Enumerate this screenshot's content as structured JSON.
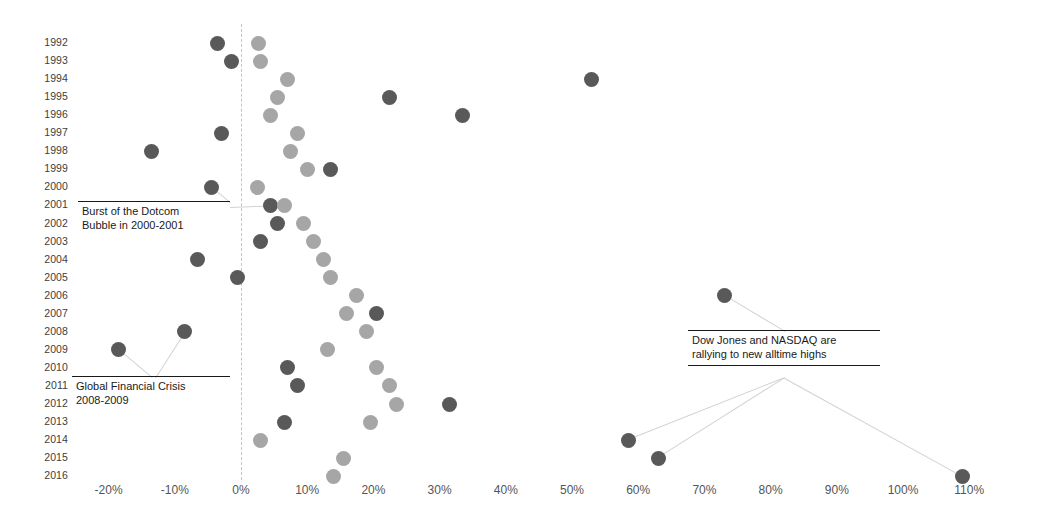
{
  "chart_data": {
    "type": "scatter",
    "title": "",
    "subtitle": "",
    "xlabel": "",
    "ylabel": "",
    "xlim": [
      -25,
      115
    ],
    "ylim_categories": true,
    "grid": false,
    "legend": "none",
    "zero_reference_line": 0,
    "xtick_labels": [
      "-20%",
      "-10%",
      "0%",
      "10%",
      "20%",
      "30%",
      "40%",
      "50%",
      "60%",
      "70%",
      "80%",
      "90%",
      "100%",
      "110%"
    ],
    "xtick_values": [
      -20,
      -10,
      0,
      10,
      20,
      30,
      40,
      50,
      60,
      70,
      80,
      90,
      100,
      110
    ],
    "categories": [
      "1992",
      "1993",
      "1994",
      "1995",
      "1996",
      "1997",
      "1998",
      "1999",
      "2000",
      "2001",
      "2002",
      "2003",
      "2004",
      "2005",
      "2006",
      "2007",
      "2008",
      "2009",
      "2010",
      "2011",
      "2012",
      "2013",
      "2014",
      "2015",
      "2016"
    ],
    "series": [
      {
        "name": "series-dark",
        "color": "#595959",
        "values": [
          -3.5,
          -1.5,
          53.0,
          22.5,
          33.5,
          -3.0,
          -13.5,
          13.5,
          -4.5,
          4.5,
          5.5,
          3.0,
          -6.5,
          -0.5,
          73.0,
          20.5,
          -8.5,
          -18.5,
          7.0,
          8.5,
          31.5,
          6.5,
          58.5,
          63.0,
          109.0
        ]
      },
      {
        "name": "series-light",
        "color": "#a6a6a6",
        "values": [
          2.7,
          3.0,
          7.0,
          5.5,
          4.5,
          8.5,
          7.5,
          10.0,
          2.5,
          6.5,
          9.5,
          11.0,
          12.5,
          13.5,
          17.5,
          16.0,
          19.0,
          13.0,
          20.5,
          22.5,
          23.5,
          19.5,
          3.0,
          15.5,
          14.0
        ]
      }
    ],
    "annotations": [
      {
        "id": "dotcom",
        "text": "Burst of the Dotcom\nBubble in 2000-2001",
        "anchor_years": [
          "2000",
          "2001"
        ]
      },
      {
        "id": "gfc",
        "text": "Global Financial Crisis\n2008-2009",
        "anchor_years": [
          "2008",
          "2009"
        ]
      },
      {
        "id": "rally",
        "text": "Dow Jones and NASDAQ are\nrallying to new alltime highs",
        "anchor_years": [
          "2014",
          "2015",
          "2016"
        ]
      }
    ]
  },
  "axis": {
    "x_label_suffix": "%",
    "zero_line_color": "#c4c4c4"
  }
}
